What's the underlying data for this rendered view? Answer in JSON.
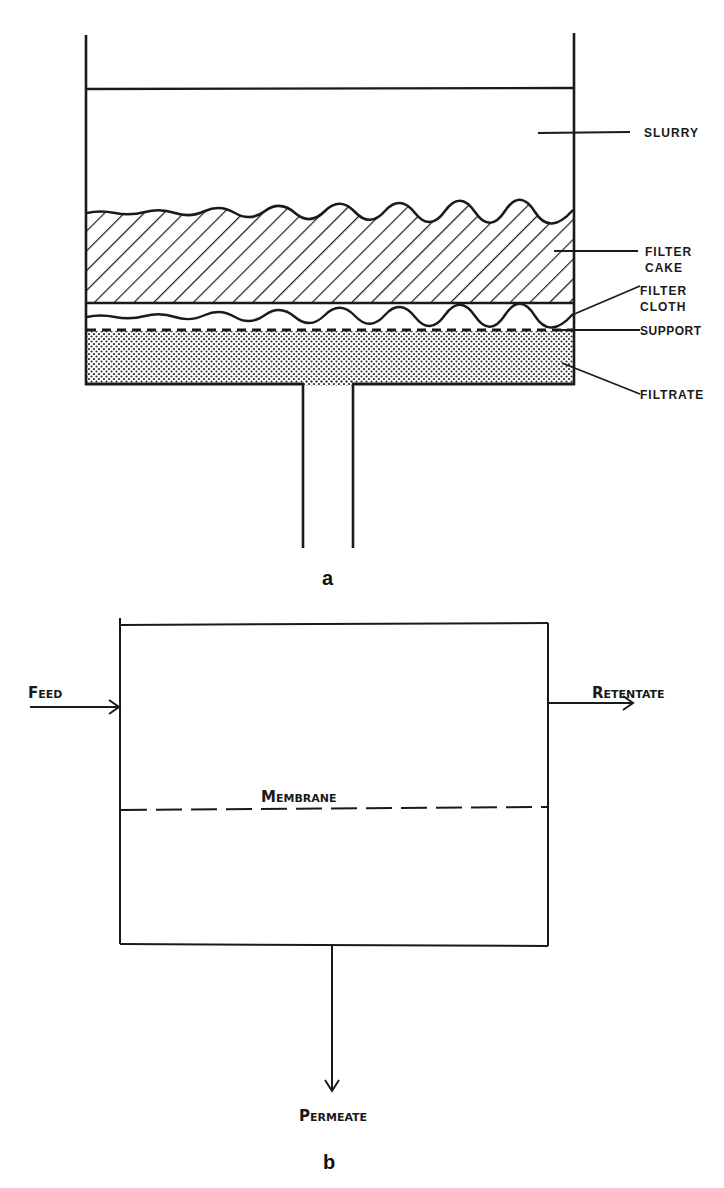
{
  "figure_a": {
    "caption": "a",
    "labels": {
      "slurry": "SLURRY",
      "filter_cake_1": "FILTER",
      "filter_cake_2": "CAKE",
      "filter_cloth_1": "FILTER",
      "filter_cloth_2": "CLOTH",
      "support": "SUPPORT",
      "filtrate": "FILTRATE"
    }
  },
  "figure_b": {
    "caption": "b",
    "labels": {
      "feed_first": "F",
      "feed_rest": "EED",
      "retentate_first": "R",
      "retentate_rest": "ETENTATE",
      "membrane_first": "M",
      "membrane_rest": "EMBRANE",
      "permeate_first": "P",
      "permeate_rest": "ERMEATE"
    }
  },
  "colors": {
    "ink": "#1a1a1a",
    "background": "#ffffff"
  }
}
